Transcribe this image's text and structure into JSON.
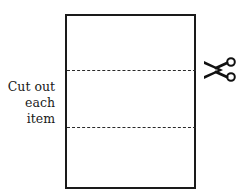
{
  "label": {
    "line1": "Cut out",
    "line2": "each",
    "line3": "item"
  },
  "icons": {
    "scissors": "scissors-icon"
  },
  "colors": {
    "stroke": "#1a1a1a",
    "background": "#ffffff"
  }
}
